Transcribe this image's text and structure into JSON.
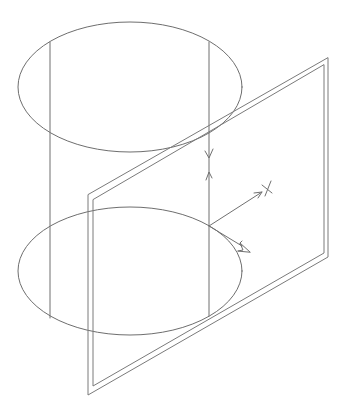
{
  "diagram": {
    "type": "cad-isometric-wireframe",
    "colors": {
      "background": "#ffffff",
      "line": "#6e6e6e",
      "frame": "#7a7a7a",
      "ucs": "#707070"
    },
    "cylinder": {
      "top_ellipse": {
        "cx": 130,
        "cy": 87,
        "rx": 112,
        "ry": 65
      },
      "bottom_ellipse": {
        "cx": 130,
        "cy": 271,
        "rx": 112,
        "ry": 64
      },
      "generators": [
        {
          "x": 50,
          "y1": 42,
          "y2": 318
        },
        {
          "x": 209,
          "y1": 42,
          "y2": 316
        }
      ]
    },
    "plane": {
      "outer": [
        [
          328,
          58
        ],
        [
          328,
          257
        ],
        [
          88,
          395
        ],
        [
          88,
          195
        ]
      ],
      "inner": [
        [
          324,
          65
        ],
        [
          324,
          253
        ],
        [
          93,
          386
        ],
        [
          93,
          200
        ]
      ]
    },
    "ucs_icon": {
      "origin": [
        209,
        226
      ],
      "x_axis_end": [
        262,
        192
      ],
      "x_marker": [
        268,
        188
      ],
      "z_axis_marker_top": [
        209,
        158
      ],
      "z_axis_arrow": [
        209,
        172
      ],
      "cone_arrow_tip": [
        250,
        252
      ],
      "icon_names": [
        "x-axis-icon",
        "y-axis-icon",
        "z-axis-icon"
      ]
    }
  }
}
